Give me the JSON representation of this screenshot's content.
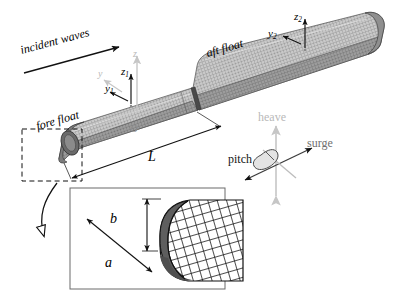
{
  "figure": {
    "background": "#ffffff",
    "width": 401,
    "height": 301
  },
  "annotations": {
    "incident_waves": "incident waves",
    "fore_float": "fore float",
    "aft_float": "aft float",
    "length": "L",
    "origin": "O"
  },
  "axes": {
    "global_z": "z",
    "global_y": "y",
    "fore_z": "z",
    "fore_z_sub": "1",
    "fore_y": "y",
    "fore_y_sub": "1",
    "aft_z": "z",
    "aft_z_sub": "2",
    "aft_y": "y",
    "aft_y_sub": "2"
  },
  "motions": {
    "heave": "heave",
    "surge": "surge",
    "pitch": "pitch"
  },
  "inset": {
    "dim_height": "b",
    "dim_width": "a"
  },
  "colors": {
    "line": "#1a1a1a",
    "hull_light": "#d2d2d2",
    "hull_mid": "#a8a8a8",
    "hull_dark": "#6e6e6e",
    "hull_seam": "#4a4a4a",
    "ghost": "#c6c6c6",
    "midgray": "#8e8e8e",
    "inset_border": "#555555"
  }
}
